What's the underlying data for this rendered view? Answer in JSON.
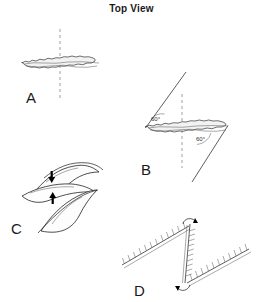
{
  "figure": {
    "title": "Top View",
    "background_color": "#ffffff",
    "ink_color": "#1a1a1a",
    "dash_color": "#888888"
  },
  "panels": [
    {
      "id": "A",
      "label": "A",
      "label_pos": {
        "x": 26,
        "y": 103
      },
      "description": "single straight fuzzy band crossed by a vertical dashed axis",
      "band": {
        "x1": 22,
        "y1": 63,
        "x2": 101,
        "y2": 63,
        "thickness": 5
      },
      "axis": {
        "x": 60,
        "y1": 29,
        "y2": 101
      },
      "annotations": []
    },
    {
      "id": "B",
      "label": "B",
      "label_pos": {
        "x": 141,
        "y": 175
      },
      "description": "fuzzy band with two straight lines meeting it at 60 degrees and a vertical dashed axis",
      "band": {
        "x1": 145,
        "y1": 128,
        "x2": 228,
        "y2": 125,
        "thickness": 5
      },
      "axis": {
        "x": 182,
        "y1": 94,
        "y2": 168
      },
      "lines": [
        {
          "x1": 145,
          "y1": 128,
          "x2": 186,
          "y2": 72
        },
        {
          "x1": 228,
          "y1": 125,
          "x2": 192,
          "y2": 182
        }
      ],
      "annotations": [
        {
          "text": "60°",
          "x": 156,
          "y": 119
        },
        {
          "text": "60°",
          "x": 202,
          "y": 139
        }
      ]
    },
    {
      "id": "C",
      "label": "C",
      "label_pos": {
        "x": 11,
        "y": 234
      },
      "description": "two curved overlapping sheets with black arrows showing downward and upward motion",
      "arrows": [
        {
          "direction": "down",
          "x": 52,
          "y": 173,
          "length": 10
        },
        {
          "direction": "up",
          "x": 53,
          "y": 201,
          "length": 10
        }
      ],
      "annotations": []
    },
    {
      "id": "D",
      "label": "D",
      "label_pos": {
        "x": 134,
        "y": 296
      },
      "description": "three hatched feathered segments in a zig-zag, curved rotation arrows at the vertical segment ends",
      "segments": [
        {
          "x1": 122,
          "y1": 265,
          "x2": 189,
          "y2": 226
        },
        {
          "x1": 190,
          "y1": 224,
          "x2": 185,
          "y2": 283
        },
        {
          "x1": 187,
          "y1": 283,
          "x2": 249,
          "y2": 249
        }
      ],
      "annotations": []
    }
  ]
}
